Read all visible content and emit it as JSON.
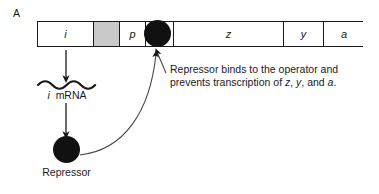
{
  "figure": {
    "panel_label": "A",
    "colors": {
      "ink": "#1a1a1a",
      "blob": "#111111",
      "shaded_segment": "#c9c9c9",
      "background": "#ffffff"
    }
  },
  "operon": {
    "name": "lac operon map",
    "segments": [
      {
        "label": "i",
        "style": "italic",
        "shaded": false,
        "width_px": 56
      },
      {
        "label": "",
        "style": "plain",
        "shaded": true,
        "width_px": 26
      },
      {
        "label": "p",
        "style": "italic",
        "shaded": false,
        "width_px": 26
      },
      {
        "label": "",
        "style": "plain",
        "shaded": false,
        "width_px": 28
      },
      {
        "label": "z",
        "style": "italic",
        "shaded": false,
        "width_px": 110
      },
      {
        "label": "y",
        "style": "italic",
        "shaded": false,
        "width_px": 40
      },
      {
        "label": "a",
        "style": "italic",
        "shaded": false,
        "width_px": 40
      }
    ]
  },
  "elements": {
    "operator_blob_name": "repressor-bound-to-operator",
    "repressor_blob_name": "repressor-protein",
    "mrna_squiggle_name": "i-mrna-transcript"
  },
  "labels": {
    "mrna_gene": "i",
    "mrna_text": "mRNA",
    "repressor": "Repressor"
  },
  "caption": {
    "line1_pre": "Repressor binds to the operator and",
    "line2_pre": "prevents transcription of ",
    "gene_z": "z",
    "sep1": ", ",
    "gene_y": "y",
    "sep2": ", and ",
    "gene_a": "a",
    "end": "."
  }
}
